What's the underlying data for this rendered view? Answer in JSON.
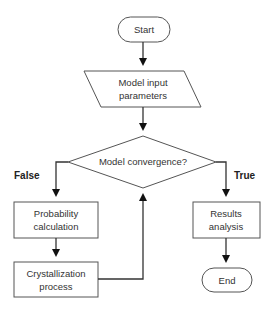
{
  "diagram": {
    "type": "flowchart",
    "nodes": {
      "start": {
        "label": "Start",
        "shape": "terminal"
      },
      "input": {
        "line1": "Model input",
        "line2": "parameters",
        "shape": "parallelogram"
      },
      "decision": {
        "label": "Model convergence?",
        "shape": "diamond"
      },
      "probability": {
        "line1": "Probability",
        "line2": "calculation",
        "shape": "rectangle"
      },
      "crystallization": {
        "line1": "Crystallization",
        "line2": "process",
        "shape": "rectangle"
      },
      "results": {
        "line1": "Results",
        "line2": "analysis",
        "shape": "rectangle"
      },
      "end": {
        "label": "End",
        "shape": "terminal"
      }
    },
    "branches": {
      "false_label": "False",
      "true_label": "True"
    },
    "edges": [
      {
        "from": "start",
        "to": "input"
      },
      {
        "from": "input",
        "to": "decision"
      },
      {
        "from": "decision",
        "to": "probability",
        "label": "False"
      },
      {
        "from": "probability",
        "to": "crystallization"
      },
      {
        "from": "crystallization",
        "to": "decision"
      },
      {
        "from": "decision",
        "to": "results",
        "label": "True"
      },
      {
        "from": "results",
        "to": "end"
      }
    ],
    "colors": {
      "stroke": "#555555",
      "line": "#333333",
      "text": "#333333",
      "background": "#ffffff"
    }
  }
}
